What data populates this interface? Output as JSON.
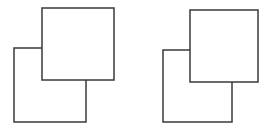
{
  "figure": {
    "title": "Two overlapping square pairs",
    "background_color": "#ffffff",
    "stroke_color": "#3a3a3a",
    "stroke_width": 1.5,
    "canvas": {
      "width": 271,
      "height": 134
    },
    "shape_count": 4,
    "group_count": 2,
    "groups": [
      {
        "name": "left-pair",
        "label": "Left figure",
        "shapes": [
          {
            "name": "lower-left-square",
            "label": "Lower-left square",
            "z": 1,
            "x": 14,
            "y": 48,
            "width": 72,
            "height": 74
          },
          {
            "name": "upper-right-square",
            "label": "Upper-right square",
            "z": 2,
            "x": 42,
            "y": 8,
            "width": 72,
            "height": 72
          }
        ]
      },
      {
        "name": "right-pair",
        "label": "Right figure",
        "shapes": [
          {
            "name": "lower-left-square",
            "label": "Lower-left square",
            "z": 1,
            "x": 163,
            "y": 50,
            "width": 69,
            "height": 72
          },
          {
            "name": "upper-right-square",
            "label": "Upper-right square",
            "z": 2,
            "x": 190,
            "y": 10,
            "width": 68,
            "height": 72
          }
        ]
      }
    ]
  }
}
